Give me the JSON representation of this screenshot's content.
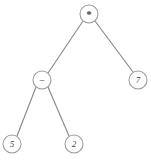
{
  "figure": {
    "name": "expression-tree",
    "background_color": "#ffffff",
    "edge_color": "#8a8a8a",
    "node_fill": "#ffffff",
    "node_stroke": "#9a9a9a",
    "label_color": "#4a4a4a",
    "width": 151,
    "height": 160
  },
  "tree": {
    "expression": "(5 - 2) * 7",
    "nodes": [
      {
        "id": "root",
        "label": "*",
        "kind": "operator",
        "cx": 89,
        "cy": 14,
        "r": 9
      },
      {
        "id": "minus",
        "label": "−",
        "kind": "operator",
        "cx": 42,
        "cy": 80,
        "r": 9
      },
      {
        "id": "seven",
        "label": "7",
        "kind": "operand",
        "cx": 138,
        "cy": 80,
        "r": 9
      },
      {
        "id": "five",
        "label": "5",
        "kind": "operand",
        "cx": 12,
        "cy": 144,
        "r": 9
      },
      {
        "id": "two",
        "label": "2",
        "kind": "operand",
        "cx": 74,
        "cy": 144,
        "r": 9
      }
    ],
    "edges": [
      {
        "id": "root-minus",
        "from": "root",
        "to": "minus",
        "x1": 83,
        "y1": 21,
        "x2": 48,
        "y2": 73
      },
      {
        "id": "root-seven",
        "from": "root",
        "to": "seven",
        "x1": 95,
        "y1": 21,
        "x2": 133,
        "y2": 72
      },
      {
        "id": "minus-five",
        "from": "minus",
        "to": "five",
        "x1": 36,
        "y1": 87,
        "x2": 17,
        "y2": 136
      },
      {
        "id": "minus-two",
        "from": "minus",
        "to": "two",
        "x1": 48,
        "y1": 87,
        "x2": 69,
        "y2": 136
      }
    ]
  }
}
